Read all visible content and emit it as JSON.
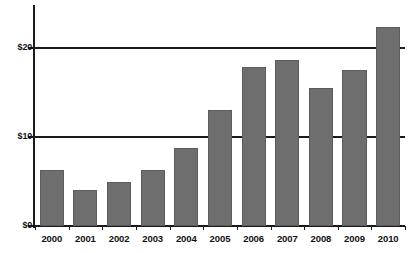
{
  "chart_data": {
    "type": "bar",
    "title": "",
    "subtitle": "",
    "xlabel": "",
    "ylabel": "",
    "categories": [
      "2000",
      "2001",
      "2002",
      "2003",
      "2004",
      "2005",
      "2006",
      "2007",
      "2008",
      "2009",
      "2010"
    ],
    "values": [
      6.3,
      4.0,
      4.9,
      6.3,
      8.8,
      13.0,
      17.9,
      18.7,
      15.5,
      17.5,
      22.4
    ],
    "series": [
      {
        "name": "",
        "values": [
          6.3,
          4.0,
          4.9,
          6.3,
          8.8,
          13.0,
          17.9,
          18.7,
          15.5,
          17.5,
          22.4
        ]
      }
    ],
    "ylim": [
      0,
      25
    ],
    "ytick_values": [
      0,
      10,
      20
    ],
    "ytick_labels": [
      "$0",
      "$10",
      "$20"
    ],
    "gridlines": [
      "horizontal at $10",
      "horizontal at $20"
    ],
    "legend": [],
    "legend_position": "none",
    "annotations": [],
    "bar_color": "#6e6e6e",
    "axis_color": "#1a1a1a",
    "background_color": "#ffffff"
  },
  "axes": {
    "y_labels": [
      {
        "text": "$20",
        "value": 20
      },
      {
        "text": "$10",
        "value": 10
      },
      {
        "text": "$0",
        "value": 0
      }
    ],
    "x_labels": [
      {
        "text": "2000"
      },
      {
        "text": "2001"
      },
      {
        "text": "2002"
      },
      {
        "text": "2003"
      },
      {
        "text": "2004"
      },
      {
        "text": "2005"
      },
      {
        "text": "2006"
      },
      {
        "text": "2007"
      },
      {
        "text": "2008"
      },
      {
        "text": "2009"
      },
      {
        "text": "2010"
      }
    ]
  }
}
